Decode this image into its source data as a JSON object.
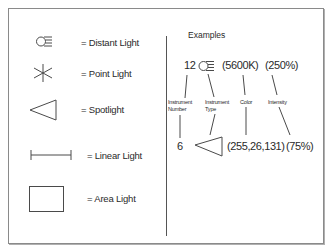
{
  "legend": {
    "items": [
      {
        "icon": "distant-light-icon",
        "label": "= Distant Light"
      },
      {
        "icon": "point-light-icon",
        "label": "= Point Light"
      },
      {
        "icon": "spotlight-icon",
        "label": "= Spotlight"
      },
      {
        "icon": "linear-light-icon",
        "label": "= Linear Light"
      },
      {
        "icon": "area-light-icon",
        "label": "= Area Light"
      }
    ]
  },
  "examples": {
    "title": "Examples",
    "example1": {
      "number": "12",
      "icon": "distant-light-icon",
      "color": "(5600K)",
      "intensity": "(250%)"
    },
    "example2": {
      "number": "6",
      "icon": "spotlight-icon",
      "color": "(255,26,131)",
      "intensity": "(75%)"
    },
    "annotations": {
      "instrument_number": [
        "Instrument",
        "Number"
      ],
      "instrument_type": [
        "Instrument",
        "Type"
      ],
      "color": "Color",
      "intensity": "Intensity"
    }
  },
  "colors": {
    "stroke": "#4a4a4a",
    "frame": "#8a8a8a"
  }
}
